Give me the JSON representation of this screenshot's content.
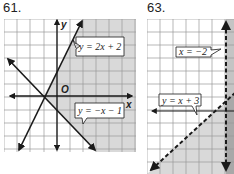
{
  "problems": [
    {
      "number": "61.",
      "graph": {
        "x_axis_label": "x",
        "y_axis_label": "y",
        "origin_label": "O",
        "lines": [
          {
            "equation": "y = 2x + 2",
            "style": "solid"
          },
          {
            "equation": "y = −x − 1",
            "style": "solid"
          }
        ],
        "shaded_region": "below y = 2x + 2 and above y = −x − 1 (right side)"
      }
    },
    {
      "number": "63.",
      "graph": {
        "lines": [
          {
            "equation": "x = −2",
            "style": "dashed"
          },
          {
            "equation": "y = x + 3",
            "style": "dashed"
          }
        ],
        "shaded_region": "below y = x + 3 and right of x = −2"
      }
    }
  ],
  "colors": {
    "grid_line": "#9a9a9a",
    "shading": "#d9d9d9",
    "dark_shading": "#b8b8b8",
    "ink": "#1a1a1a"
  }
}
